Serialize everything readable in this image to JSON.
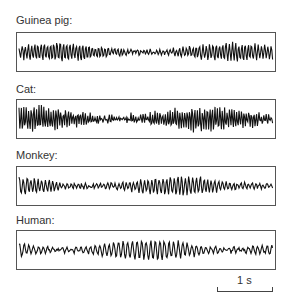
{
  "chart_data": {
    "type": "line",
    "title": "",
    "xlabel": "",
    "ylabel": "",
    "grid": false,
    "legend": "none",
    "scale_bar": {
      "label": "1 s",
      "duration_s": 1
    },
    "panels": [
      {
        "name": "Guinea pig",
        "label": "Guinea pig:",
        "amplitude": 0.45,
        "freq": 16,
        "irregular": 0.35
      },
      {
        "name": "Cat",
        "label": "Cat:",
        "amplitude": 0.6,
        "freq": 21,
        "irregular": 0.5
      },
      {
        "name": "Monkey",
        "label": "Monkey:",
        "amplitude": 0.45,
        "freq": 14,
        "irregular": 0.4
      },
      {
        "name": "Human",
        "label": "Human:",
        "amplitude": 0.5,
        "freq": 11,
        "irregular": 0.35
      }
    ]
  },
  "labels": {
    "p0": "Guinea pig:",
    "p1": "Cat:",
    "p2": "Monkey:",
    "p3": "Human:",
    "scale": "1 s"
  },
  "colors": {
    "trace": "#111111",
    "frame": "#555555"
  }
}
